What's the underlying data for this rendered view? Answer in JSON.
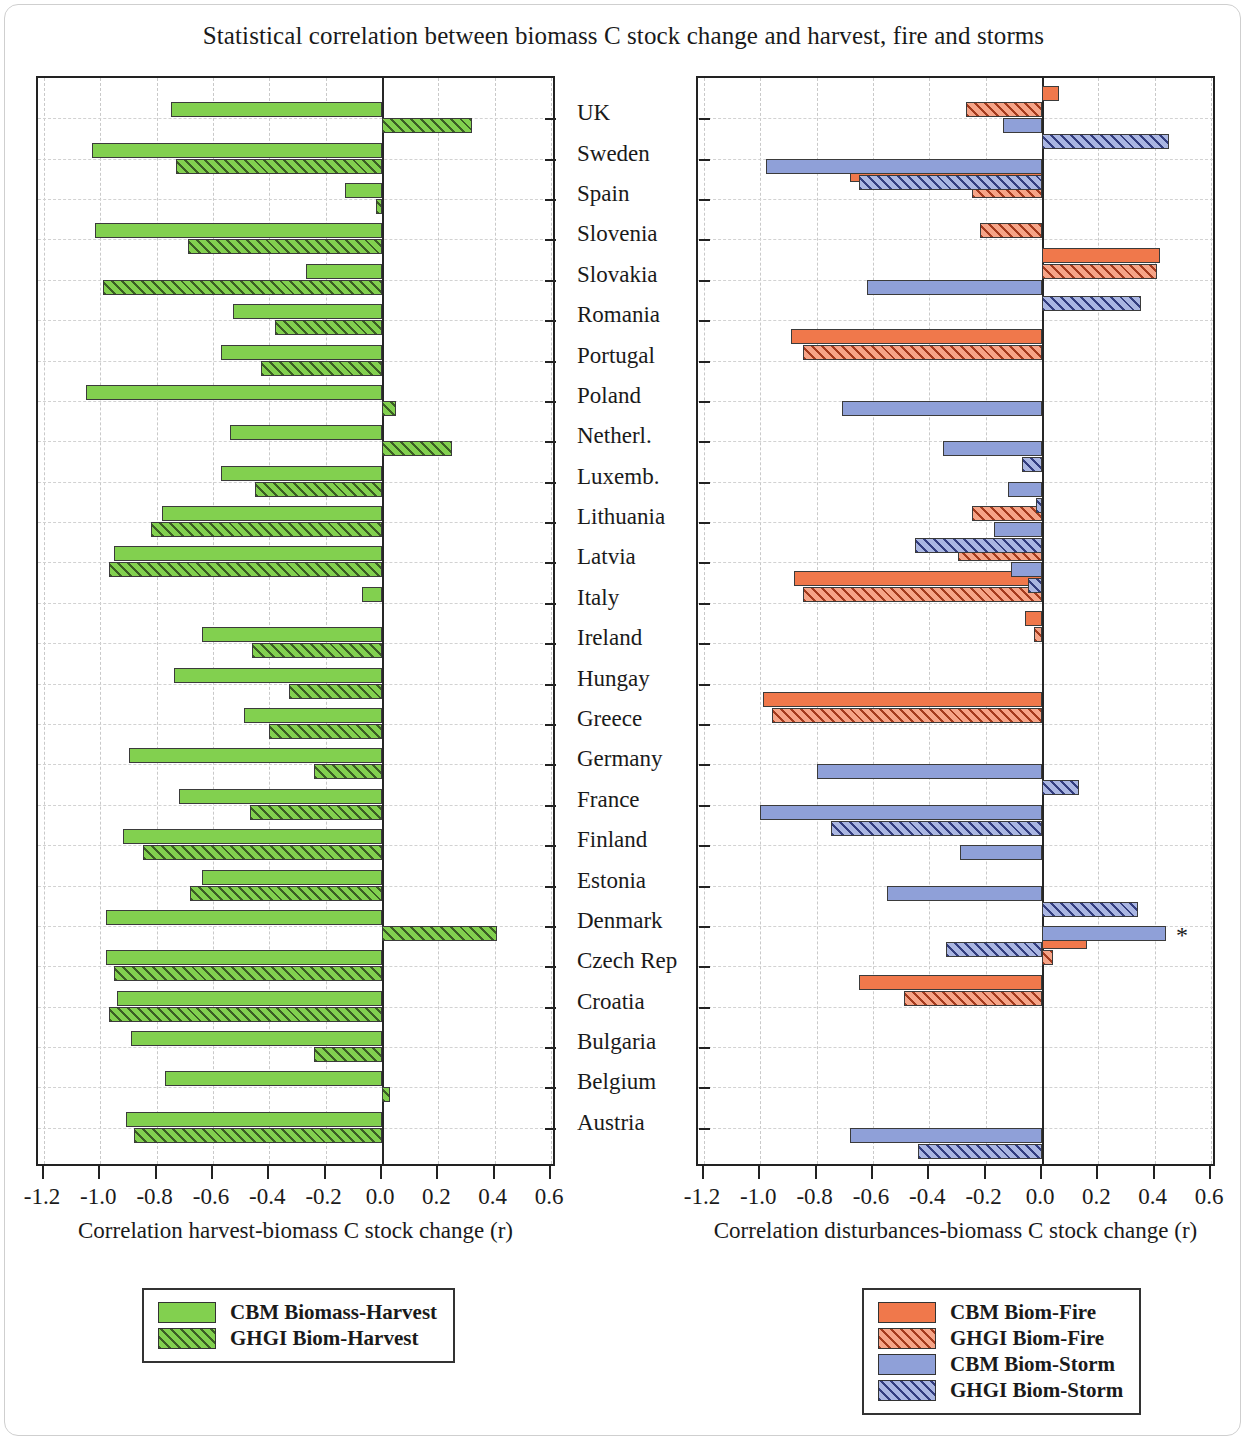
{
  "title": "Statistical correlation between biomass C stock change and harvest, fire and storms",
  "chart_data": {
    "type": "bar",
    "orientation": "horizontal",
    "title": "Statistical correlation between biomass C stock change and harvest, fire and storms",
    "grid": true,
    "panels": [
      {
        "id": "harvest",
        "xlabel": "Correlation harvest-biomass C stock change (r)",
        "xlim": [
          -1.2,
          0.6
        ],
        "xticks": [
          -1.2,
          -1.0,
          -0.8,
          -0.6,
          -0.4,
          -0.2,
          0.0,
          0.2,
          0.4,
          0.6
        ],
        "xticklabels": [
          "-1.2",
          "-1.0",
          "-0.8",
          "-0.6",
          "-0.4",
          "-0.2",
          "0.0",
          "0.2",
          "0.4",
          "0.6"
        ],
        "categories": [
          "UK",
          "Sweden",
          "Spain",
          "Slovenia",
          "Slovakia",
          "Romania",
          "Portugal",
          "Poland",
          "Netherl.",
          "Luxemb.",
          "Lithuania",
          "Latvia",
          "Italy",
          "Ireland",
          "Hungay",
          "Greece",
          "Germany",
          "France",
          "Finland",
          "Estonia",
          "Denmark",
          "Czech Rep",
          "Croatia",
          "Bulgaria",
          "Belgium",
          "Austria"
        ],
        "series": [
          {
            "name": "CBM Biomass-Harvest",
            "color": "#82d04f",
            "pattern": "solid",
            "values": [
              -0.75,
              -1.03,
              -0.13,
              -1.02,
              -0.27,
              -0.53,
              -0.57,
              -1.05,
              -0.54,
              -0.57,
              -0.78,
              -0.95,
              -0.07,
              -0.64,
              -0.74,
              -0.49,
              -0.9,
              -0.72,
              -0.92,
              -0.64,
              -0.98,
              -0.98,
              -0.94,
              -0.89,
              -0.77,
              -0.91
            ]
          },
          {
            "name": "GHGI Biom-Harvest",
            "color": "#82d04f",
            "pattern": "hatched",
            "values": [
              0.32,
              -0.73,
              -0.02,
              -0.69,
              -0.99,
              -0.38,
              -0.43,
              0.05,
              0.25,
              -0.45,
              -0.82,
              -0.97,
              null,
              -0.46,
              -0.33,
              -0.4,
              -0.24,
              -0.47,
              -0.85,
              -0.68,
              0.41,
              -0.95,
              -0.97,
              -0.24,
              0.03,
              -0.88
            ]
          }
        ]
      },
      {
        "id": "disturbances",
        "xlabel": "Correlation disturbances-biomass C stock change (r)",
        "xlim": [
          -1.2,
          0.6
        ],
        "xticks": [
          -1.2,
          -1.0,
          -0.8,
          -0.6,
          -0.4,
          -0.2,
          0.0,
          0.2,
          0.4,
          0.6
        ],
        "xticklabels": [
          "-1.2",
          "-1.0",
          "-0.8",
          "-0.6",
          "-0.4",
          "-0.2",
          "0.0",
          "0.2",
          "0.4",
          "0.6"
        ],
        "categories": [
          "UK",
          "Sweden",
          "Spain",
          "Slovenia",
          "Slovakia",
          "Romania",
          "Portugal",
          "Poland",
          "Netherl.",
          "Luxemb.",
          "Lithuania",
          "Latvia",
          "Italy",
          "Ireland",
          "Hungay",
          "Greece",
          "Germany",
          "France",
          "Finland",
          "Estonia",
          "Denmark",
          "Czech Rep",
          "Croatia",
          "Bulgaria",
          "Belgium",
          "Austria"
        ],
        "annotations": [
          {
            "text": "*",
            "category": "Denmark",
            "series": "CBM Biom-Storm"
          }
        ],
        "series": [
          {
            "name": "CBM Biom-Fire",
            "color": "#f0784b",
            "pattern": "solid",
            "values": [
              0.06,
              null,
              -0.68,
              null,
              0.42,
              null,
              -0.89,
              null,
              null,
              null,
              null,
              null,
              -0.88,
              -0.06,
              null,
              -0.99,
              null,
              null,
              null,
              null,
              null,
              0.16,
              -0.65,
              null,
              null,
              null
            ]
          },
          {
            "name": "GHGI Biom-Fire",
            "color": "#f0784b",
            "pattern": "hatched",
            "values": [
              -0.27,
              null,
              -0.25,
              -0.22,
              0.41,
              null,
              -0.85,
              null,
              null,
              null,
              -0.25,
              -0.3,
              -0.85,
              -0.03,
              null,
              -0.96,
              null,
              null,
              null,
              null,
              null,
              0.04,
              -0.49,
              null,
              null,
              null
            ]
          },
          {
            "name": "CBM Biom-Storm",
            "color": "#8fa0d8",
            "pattern": "solid",
            "values": [
              -0.14,
              -0.98,
              null,
              null,
              -0.62,
              null,
              null,
              -0.71,
              -0.35,
              -0.12,
              -0.17,
              -0.11,
              null,
              null,
              null,
              null,
              -0.8,
              -1.0,
              -0.29,
              -0.55,
              0.44,
              null,
              null,
              null,
              null,
              -0.68
            ]
          },
          {
            "name": "GHGI Biom-Storm",
            "color": "#8fa0d8",
            "pattern": "hatched",
            "values": [
              0.45,
              -0.65,
              null,
              null,
              0.35,
              null,
              null,
              null,
              -0.07,
              -0.02,
              -0.45,
              -0.05,
              null,
              null,
              null,
              null,
              0.13,
              -0.75,
              null,
              0.34,
              -0.34,
              null,
              null,
              null,
              null,
              -0.44
            ]
          }
        ]
      }
    ],
    "legends": [
      {
        "panel": "harvest",
        "entries": [
          {
            "label": "CBM Biomass-Harvest",
            "color": "#82d04f",
            "pattern": "solid"
          },
          {
            "label": "GHGI Biom-Harvest",
            "color": "#82d04f",
            "pattern": "hatched"
          }
        ]
      },
      {
        "panel": "disturbances",
        "entries": [
          {
            "label": "CBM Biom-Fire",
            "color": "#f0784b",
            "pattern": "solid"
          },
          {
            "label": "GHGI Biom-Fire",
            "color": "#f0784b",
            "pattern": "hatched"
          },
          {
            "label": "CBM Biom-Storm",
            "color": "#8fa0d8",
            "pattern": "solid"
          },
          {
            "label": "GHGI Biom-Storm",
            "color": "#8fa0d8",
            "pattern": "hatched"
          }
        ]
      }
    ]
  }
}
